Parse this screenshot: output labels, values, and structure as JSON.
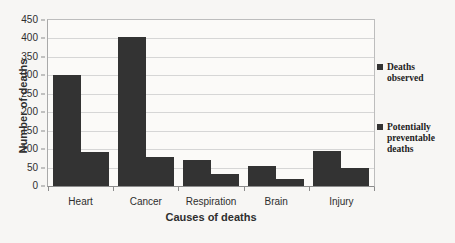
{
  "chart_data": {
    "type": "bar",
    "title": "",
    "xlabel": "Causes of deaths",
    "ylabel": "Number of deaths",
    "categories": [
      "Heart",
      "Cancer",
      "Respiration",
      "Brain",
      "Injury"
    ],
    "series": [
      {
        "name": "Deaths observed",
        "values": [
          300,
          403,
          70,
          55,
          95
        ]
      },
      {
        "name": "Potentially preventable deaths",
        "values": [
          92,
          80,
          32,
          20,
          48
        ]
      }
    ],
    "ylim": [
      0,
      450
    ],
    "yticks": [
      0,
      50,
      100,
      150,
      200,
      250,
      300,
      350,
      400,
      450
    ],
    "ytick_labels": [
      "0",
      "50",
      "100",
      "150",
      "200",
      "250",
      "300",
      "350",
      "400",
      "450"
    ],
    "grid": "horizontal",
    "legend_position": "right",
    "bar_color": "#333333",
    "gridline_color": "#d6d6d6",
    "background_color": "#f7f6f4",
    "plot_background_color": "#fbfaf8"
  },
  "legend": {
    "items": [
      {
        "label_line1": "Deaths",
        "label_line2": "observed",
        "swatch": "legend-swatch-deaths-observed"
      },
      {
        "label_line1": "Potentially",
        "label_line2": "preventable",
        "label_line3": "deaths",
        "swatch": "legend-swatch-potentially-preventable"
      }
    ]
  }
}
